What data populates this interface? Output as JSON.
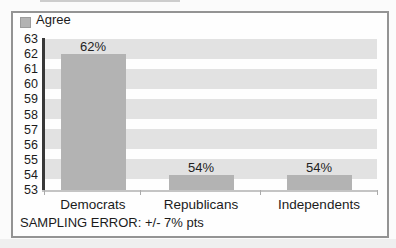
{
  "legend": {
    "label": "Agree"
  },
  "y_axis": {
    "ticks": [
      "63",
      "62",
      "61",
      "60",
      "59",
      "58",
      "57",
      "56",
      "55",
      "54",
      "53"
    ]
  },
  "footer": {
    "text": "SAMPLING ERROR: +/- 7% pts"
  },
  "colors": {
    "bar": "#b3b3b3",
    "stripe": "#e2e2e2",
    "axis_line": "#383838",
    "baseline": "#c4c4c4",
    "cat_tick": "#ababab",
    "frame": "#949494",
    "text": "#1b1b1b"
  },
  "chart_data": {
    "type": "bar",
    "title": "",
    "categories": [
      "Democrats",
      "Republicans",
      "Independents"
    ],
    "values": [
      62,
      54,
      54
    ],
    "value_labels": [
      "62%",
      "54%",
      "54%"
    ],
    "series_name": "Agree",
    "legend": [
      "Agree"
    ],
    "legend_position": "top-left",
    "xlabel": "",
    "ylabel": "",
    "ylim": [
      53,
      63
    ],
    "yticks": [
      63,
      62,
      61,
      60,
      59,
      58,
      57,
      56,
      55,
      54,
      53
    ],
    "grid": "horizontal-gray-bands",
    "footnote": "SAMPLING ERROR: +/- 7% pts"
  }
}
